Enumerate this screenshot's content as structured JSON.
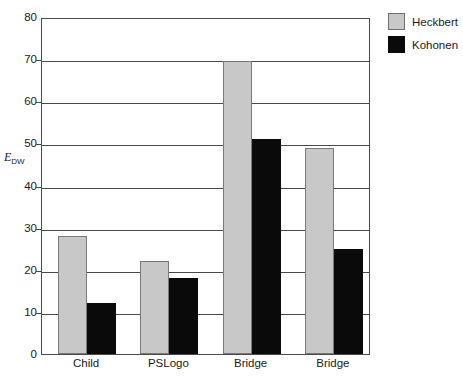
{
  "chart_data": {
    "type": "bar",
    "title": "",
    "xlabel": "",
    "ylabel": "E_DW",
    "ylabel_base": "E",
    "ylabel_sub": "DW",
    "categories": [
      "Child",
      "PSLogo",
      "Bridge",
      "Bridge"
    ],
    "series": [
      {
        "name": "Heckbert",
        "color": "#c8c8c8",
        "values": [
          28,
          22,
          69.5,
          49
        ]
      },
      {
        "name": "Kohonen",
        "color": "#0a0a0a",
        "values": [
          12,
          18,
          51,
          25
        ]
      }
    ],
    "ylim": [
      0,
      80
    ],
    "ytick_values": [
      0,
      10,
      20,
      30,
      40,
      50,
      60,
      70,
      80
    ],
    "ytick_labels": [
      "0",
      "10",
      "20",
      "30",
      "40",
      "50",
      "60",
      "70",
      "80"
    ],
    "grid": true,
    "legend_position": "top-right",
    "legend_entries": [
      "Heckbert",
      "Kohonen"
    ]
  }
}
